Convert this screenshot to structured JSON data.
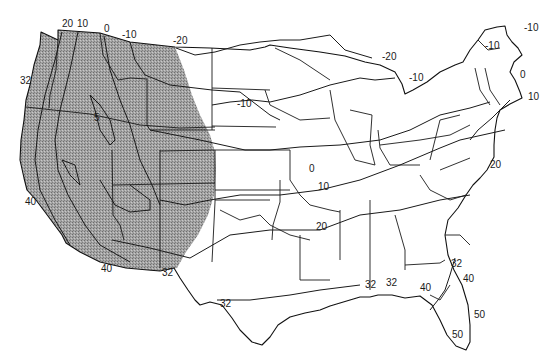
{
  "map": {
    "subject": "Contiguous United States isotherm map",
    "shaded_region": {
      "description": "Western United States (stippled gray)",
      "color": "#9a9a9a"
    },
    "labels": [
      {
        "id": "l1",
        "text": "20",
        "x": 62,
        "y": 27
      },
      {
        "id": "l2",
        "text": "10",
        "x": 77,
        "y": 27
      },
      {
        "id": "l3",
        "text": "0",
        "x": 104,
        "y": 32
      },
      {
        "id": "l4",
        "text": "-10",
        "x": 122,
        "y": 38
      },
      {
        "id": "l5",
        "text": "-20",
        "x": 173,
        "y": 44
      },
      {
        "id": "l6",
        "text": "32",
        "x": 20,
        "y": 84
      },
      {
        "id": "l7",
        "text": "5",
        "x": 94,
        "y": 121
      },
      {
        "id": "l8",
        "text": "-10",
        "x": 237,
        "y": 107
      },
      {
        "id": "l9",
        "text": "-20",
        "x": 382,
        "y": 60
      },
      {
        "id": "l10",
        "text": "-10",
        "x": 409,
        "y": 81
      },
      {
        "id": "l11",
        "text": "-10",
        "x": 485,
        "y": 49
      },
      {
        "id": "l12",
        "text": "-10",
        "x": 524,
        "y": 31
      },
      {
        "id": "l13",
        "text": "0",
        "x": 520,
        "y": 78
      },
      {
        "id": "l14",
        "text": "10",
        "x": 528,
        "y": 100
      },
      {
        "id": "l15",
        "text": "0",
        "x": 309,
        "y": 172
      },
      {
        "id": "l16",
        "text": "10",
        "x": 318,
        "y": 190
      },
      {
        "id": "l17",
        "text": "20",
        "x": 490,
        "y": 168
      },
      {
        "id": "l18",
        "text": "20",
        "x": 316,
        "y": 230
      },
      {
        "id": "l19",
        "text": "40",
        "x": 25,
        "y": 205
      },
      {
        "id": "l20",
        "text": "40",
        "x": 101,
        "y": 272
      },
      {
        "id": "l21",
        "text": "32",
        "x": 162,
        "y": 276
      },
      {
        "id": "l22",
        "text": "32",
        "x": 220,
        "y": 307
      },
      {
        "id": "l23",
        "text": "32",
        "x": 365,
        "y": 288
      },
      {
        "id": "l24",
        "text": "32",
        "x": 386,
        "y": 286
      },
      {
        "id": "l25",
        "text": "40",
        "x": 420,
        "y": 291
      },
      {
        "id": "l26",
        "text": "32",
        "x": 451,
        "y": 267
      },
      {
        "id": "l27",
        "text": "40",
        "x": 463,
        "y": 282
      },
      {
        "id": "l28",
        "text": "50",
        "x": 474,
        "y": 318
      },
      {
        "id": "l29",
        "text": "50",
        "x": 452,
        "y": 338
      }
    ]
  }
}
